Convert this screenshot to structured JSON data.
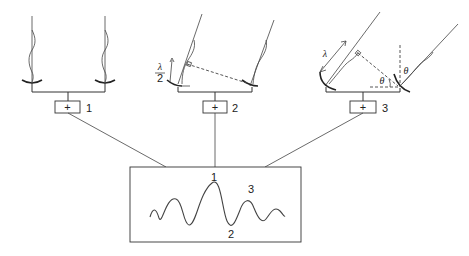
{
  "diagram": {
    "configurations": [
      {
        "id": 1,
        "label": "1",
        "adder_symbol": "+",
        "description": "Source at zenith, waves arrive in phase"
      },
      {
        "id": 2,
        "label": "2",
        "adder_symbol": "+",
        "path_difference_label": "λ",
        "path_difference_denominator": "2",
        "description": "Path difference λ/2, destructive"
      },
      {
        "id": 3,
        "label": "3",
        "adder_symbol": "+",
        "path_difference_label": "λ",
        "angle_label": "θ",
        "description": "Path difference λ, constructive"
      }
    ],
    "output_box": {
      "peak_labels": [
        "1",
        "3"
      ],
      "trough_label": "2"
    }
  }
}
